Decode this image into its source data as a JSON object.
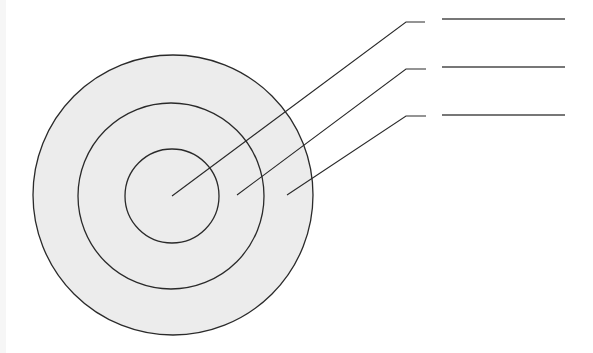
{
  "diagram": {
    "type": "concentric-circles-with-callouts",
    "width": 593,
    "height": 353,
    "colors": {
      "fill": "#ececec",
      "stroke": "#2a2a2a",
      "label_line": "#4a4a4a",
      "background": "#ffffff"
    },
    "circles": [
      {
        "name": "outer-ring",
        "cx": 173,
        "cy": 195,
        "r": 140
      },
      {
        "name": "middle-ring",
        "cx": 171,
        "cy": 196,
        "r": 93
      },
      {
        "name": "inner-ring",
        "cx": 172,
        "cy": 196,
        "r": 47
      }
    ],
    "callouts": [
      {
        "name": "callout-inner",
        "anchor": [
          172,
          196
        ],
        "elbow": [
          406,
          22
        ],
        "elbow_end": [
          425,
          22
        ],
        "label_line": [
          442,
          19,
          565,
          19
        ],
        "label": ""
      },
      {
        "name": "callout-middle",
        "anchor": [
          237,
          195
        ],
        "elbow": [
          406,
          69
        ],
        "elbow_end": [
          426,
          69
        ],
        "label_line": [
          442,
          67,
          565,
          67
        ],
        "label": ""
      },
      {
        "name": "callout-outer",
        "anchor": [
          287,
          195
        ],
        "elbow": [
          406,
          116
        ],
        "elbow_end": [
          426,
          116
        ],
        "label_line": [
          442,
          115,
          565,
          115
        ],
        "label": ""
      }
    ]
  }
}
